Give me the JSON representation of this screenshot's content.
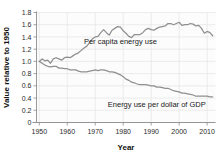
{
  "chart_data": {
    "type": "line",
    "title": "",
    "xlabel": "Year",
    "ylabel": "Value relative to 1950",
    "xlim": [
      1949,
      2013
    ],
    "ylim": [
      0,
      1.8
    ],
    "grid": true,
    "legend_position": "inline-annotation",
    "xticks": [
      1950,
      1960,
      1970,
      1980,
      1990,
      2000,
      2010
    ],
    "xtick_labels": [
      "1950",
      "1960",
      "1970",
      "1980",
      "1990",
      "2000",
      "2010"
    ],
    "yticks": [
      0,
      0.2,
      0.4,
      0.6,
      0.8,
      1.0,
      1.2,
      1.4,
      1.6,
      1.8
    ],
    "ytick_labels": [
      "0",
      "0.2",
      "0.4",
      "0.6",
      "0.8",
      "1.0",
      "1.2",
      "1.4",
      "1.6",
      "1.8"
    ],
    "line_color": "#8f8f8f",
    "x": [
      1950,
      1951,
      1952,
      1953,
      1954,
      1955,
      1956,
      1957,
      1958,
      1959,
      1960,
      1961,
      1962,
      1963,
      1964,
      1965,
      1966,
      1967,
      1968,
      1969,
      1970,
      1971,
      1972,
      1973,
      1974,
      1975,
      1976,
      1977,
      1978,
      1979,
      1980,
      1981,
      1982,
      1983,
      1984,
      1985,
      1986,
      1987,
      1988,
      1989,
      1990,
      1991,
      1992,
      1993,
      1994,
      1995,
      1996,
      1997,
      1998,
      1999,
      2000,
      2001,
      2002,
      2003,
      2004,
      2005,
      2006,
      2007,
      2008,
      2009,
      2010,
      2011,
      2012
    ],
    "series": [
      {
        "name": "Per capita energy use",
        "annotation": "Per capita energy use",
        "annotation_x": 1979,
        "annotation_y": 1.285,
        "color": "#8f8f8f",
        "values": [
          1.0,
          1.04,
          1.01,
          1.02,
          0.97,
          1.04,
          1.06,
          1.04,
          1.02,
          1.06,
          1.07,
          1.06,
          1.09,
          1.12,
          1.14,
          1.18,
          1.22,
          1.25,
          1.31,
          1.37,
          1.4,
          1.41,
          1.47,
          1.52,
          1.47,
          1.43,
          1.51,
          1.54,
          1.57,
          1.56,
          1.5,
          1.46,
          1.41,
          1.39,
          1.44,
          1.44,
          1.44,
          1.47,
          1.52,
          1.54,
          1.52,
          1.51,
          1.54,
          1.56,
          1.57,
          1.58,
          1.62,
          1.62,
          1.6,
          1.62,
          1.64,
          1.59,
          1.6,
          1.6,
          1.62,
          1.61,
          1.58,
          1.59,
          1.54,
          1.46,
          1.49,
          1.47,
          1.42
        ]
      },
      {
        "name": "Energy use per dollar of GDP",
        "annotation": "Energy use per dollar of GDP",
        "annotation_x": 1992,
        "annotation_y": 0.255,
        "color": "#8f8f8f",
        "values": [
          1.0,
          0.97,
          0.94,
          0.92,
          0.91,
          0.92,
          0.92,
          0.89,
          0.89,
          0.88,
          0.88,
          0.86,
          0.86,
          0.86,
          0.84,
          0.83,
          0.83,
          0.83,
          0.84,
          0.85,
          0.86,
          0.85,
          0.86,
          0.86,
          0.85,
          0.83,
          0.83,
          0.82,
          0.8,
          0.78,
          0.75,
          0.71,
          0.69,
          0.66,
          0.65,
          0.63,
          0.62,
          0.62,
          0.62,
          0.61,
          0.6,
          0.6,
          0.58,
          0.58,
          0.57,
          0.56,
          0.56,
          0.54,
          0.52,
          0.51,
          0.5,
          0.48,
          0.48,
          0.47,
          0.46,
          0.45,
          0.43,
          0.43,
          0.43,
          0.43,
          0.43,
          0.42,
          0.42
        ]
      }
    ]
  }
}
